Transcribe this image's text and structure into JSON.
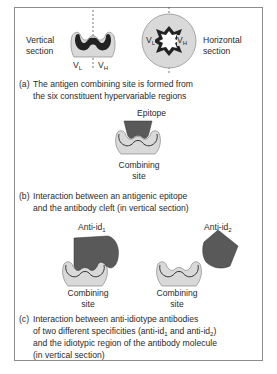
{
  "panel_a": {
    "left_label_line1": "Vertical",
    "left_label_line2": "section",
    "right_label_line1": "Horizontal",
    "right_label_line2": "section",
    "vl_main": "V",
    "vl_sub": "L",
    "vh_main": "V",
    "vh_sub": "H",
    "caption_tag": "(a)",
    "caption_line1": "The antigen combining site is formed from",
    "caption_line2": "the six constituent hypervariable regions"
  },
  "panel_b": {
    "epitope_label": "Epitope",
    "site_line1": "Combining",
    "site_line2": "site",
    "caption_tag": "(b)",
    "caption_line1": "Interaction between an antigenic epitope",
    "caption_line2": "and the antibody cleft (in vertical section)"
  },
  "panel_c": {
    "anti_id1_main": "Anti-id",
    "anti_id1_sub": "1",
    "anti_id2_main": "Anti-id",
    "anti_id2_sub": "2",
    "site1_line1": "Combining",
    "site1_line2": "site",
    "site2_line1": "Combining",
    "site2_line2": "site",
    "caption_tag": "(c)",
    "caption_line1": "Interaction between anti-idiotype antibodies",
    "caption_line2_pre": "of two different specificities (anti-id",
    "caption_line2_sub1": "1",
    "caption_line2_mid": " and anti-id",
    "caption_line2_sub2": "2",
    "caption_line2_post": ")",
    "caption_line3": "and the idiotypic region of the antibody molecule",
    "caption_line4": "(in vertical section)"
  },
  "colors": {
    "frame": "#8c8c8c",
    "antibody_fill": "#d9d9d9",
    "hypervariable_dark": "#222222",
    "antigen_fill": "#595959"
  }
}
